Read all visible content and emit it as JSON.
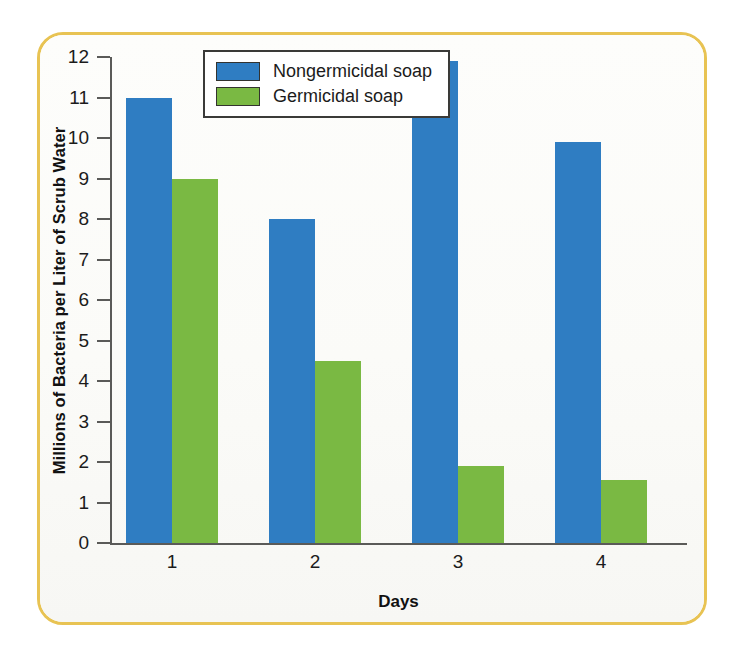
{
  "chart_data": {
    "type": "bar",
    "title": "",
    "xlabel": "Days",
    "ylabel": "Millions of Bacteria per Liter of Scrub Water",
    "categories": [
      "1",
      "2",
      "3",
      "4"
    ],
    "series": [
      {
        "name": "Nongermicidal soap",
        "color": "#2f7dc2",
        "values": [
          11.0,
          8.0,
          11.9,
          9.9
        ]
      },
      {
        "name": "Germicidal soap",
        "color": "#7ab943",
        "values": [
          9.0,
          4.5,
          1.9,
          1.55
        ]
      }
    ],
    "ylim": [
      0,
      12
    ],
    "ytick_labels": [
      "0",
      "1",
      "2",
      "3",
      "4",
      "5",
      "6",
      "7",
      "8",
      "9",
      "10",
      "11",
      "12"
    ],
    "ytick_values": [
      0,
      1,
      2,
      3,
      4,
      5,
      6,
      7,
      8,
      9,
      10,
      11,
      12
    ],
    "grid": false,
    "legend_position": "top-center",
    "frame_color": "#e8c353",
    "axis_color": "#5a5a58"
  }
}
